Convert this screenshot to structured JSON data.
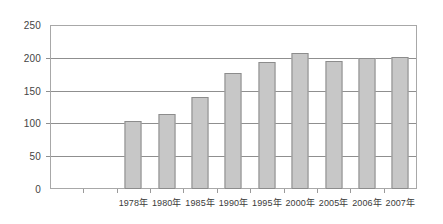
{
  "chart_data": {
    "type": "bar",
    "title": "",
    "subtitle": "",
    "xlabel": "",
    "ylabel": "",
    "categories": [
      "1978年",
      "1980年",
      "1985年",
      "1990年",
      "1995年",
      "2000年",
      "2005年",
      "2006年",
      "2007年"
    ],
    "values": [
      104,
      115,
      141,
      177,
      193,
      208,
      195,
      200,
      201
    ],
    "ylim": [
      0,
      250
    ],
    "ytick_labels": [
      "0",
      "50",
      "100",
      "150",
      "200",
      "250"
    ],
    "ytick_values": [
      0,
      50,
      100,
      150,
      200,
      250
    ],
    "grid": true,
    "grid_axis": "y",
    "legend": "none",
    "series": [
      {
        "name": "",
        "values": [
          104,
          115,
          141,
          177,
          193,
          208,
          195,
          200,
          201
        ]
      }
    ],
    "empty_leading_slots": 2,
    "colors": {
      "bar_fill": "#c7c7c7",
      "bar_border": "#8c8c8c",
      "gridline": "#8f8f8f",
      "frame": "#a8a8a8",
      "plot_background": "#ffffff",
      "page_background": "#ffffff",
      "y_label_text": "#444444",
      "x_label_text": "#3a3a3a"
    }
  }
}
